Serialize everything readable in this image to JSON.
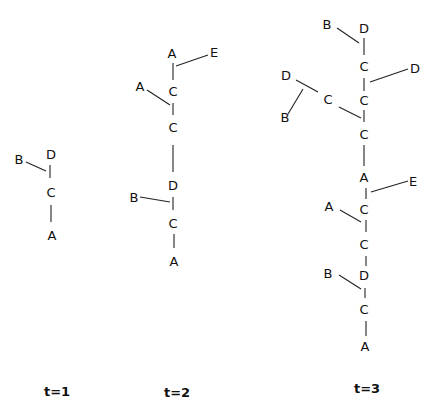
{
  "diagram": {
    "type": "tree-growth",
    "panels": [
      {
        "caption": "t=1",
        "nodes": [
          {
            "id": "t1_B",
            "label": "B",
            "x": 19,
            "y": 160
          },
          {
            "id": "t1_D",
            "label": "D",
            "x": 51,
            "y": 155
          },
          {
            "id": "t1_C",
            "label": "C",
            "x": 51,
            "y": 193
          },
          {
            "id": "t1_A",
            "label": "A",
            "x": 52,
            "y": 236
          }
        ],
        "edges": [
          [
            26,
            162,
            46,
            171
          ],
          [
            50,
            165,
            50,
            178
          ],
          [
            51,
            205,
            51,
            222
          ]
        ]
      },
      {
        "caption": "t=2",
        "nodes": [
          {
            "id": "t2_A1",
            "label": "A",
            "x": 172,
            "y": 54
          },
          {
            "id": "t2_E",
            "label": "E",
            "x": 214,
            "y": 53
          },
          {
            "id": "t2_A2",
            "label": "A",
            "x": 140,
            "y": 87
          },
          {
            "id": "t2_C1",
            "label": "C",
            "x": 173,
            "y": 92
          },
          {
            "id": "t2_C2",
            "label": "C",
            "x": 173,
            "y": 128
          },
          {
            "id": "t2_D",
            "label": "D",
            "x": 173,
            "y": 186
          },
          {
            "id": "t2_B",
            "label": "B",
            "x": 134,
            "y": 198
          },
          {
            "id": "t2_C3",
            "label": "C",
            "x": 173,
            "y": 224
          },
          {
            "id": "t2_A3",
            "label": "A",
            "x": 174,
            "y": 262
          }
        ],
        "edges": [
          [
            173,
            63,
            173,
            80
          ],
          [
            176,
            66,
            208,
            55
          ],
          [
            147,
            90,
            170,
            105
          ],
          [
            173,
            103,
            173,
            115
          ],
          [
            173,
            145,
            173,
            172
          ],
          [
            140,
            197,
            170,
            202
          ],
          [
            173,
            197,
            173,
            210
          ],
          [
            174,
            234,
            174,
            248
          ]
        ]
      },
      {
        "caption": "t=3",
        "nodes": [
          {
            "id": "t3_B1",
            "label": "B",
            "x": 327,
            "y": 25
          },
          {
            "id": "t3_D1",
            "label": "D",
            "x": 364,
            "y": 29
          },
          {
            "id": "t3_C1",
            "label": "C",
            "x": 364,
            "y": 67
          },
          {
            "id": "t3_D2",
            "label": "D",
            "x": 415,
            "y": 69
          },
          {
            "id": "t3_D3",
            "label": "D",
            "x": 286,
            "y": 76
          },
          {
            "id": "t3_C2",
            "label": "C",
            "x": 328,
            "y": 100
          },
          {
            "id": "t3_C3",
            "label": "C",
            "x": 364,
            "y": 101
          },
          {
            "id": "t3_B2",
            "label": "B",
            "x": 285,
            "y": 118
          },
          {
            "id": "t3_C4",
            "label": "C",
            "x": 364,
            "y": 135
          },
          {
            "id": "t3_A1",
            "label": "A",
            "x": 364,
            "y": 178
          },
          {
            "id": "t3_E",
            "label": "E",
            "x": 413,
            "y": 182
          },
          {
            "id": "t3_A2",
            "label": "A",
            "x": 329,
            "y": 207
          },
          {
            "id": "t3_C5",
            "label": "C",
            "x": 364,
            "y": 210
          },
          {
            "id": "t3_C6",
            "label": "C",
            "x": 364,
            "y": 245
          },
          {
            "id": "t3_B3",
            "label": "B",
            "x": 328,
            "y": 274
          },
          {
            "id": "t3_D4",
            "label": "D",
            "x": 364,
            "y": 276
          },
          {
            "id": "t3_C7",
            "label": "C",
            "x": 364,
            "y": 310
          },
          {
            "id": "t3_A3",
            "label": "A",
            "x": 365,
            "y": 347
          }
        ],
        "edges": [
          [
            337,
            28,
            359,
            43
          ],
          [
            364,
            38,
            364,
            55
          ],
          [
            370,
            82,
            408,
            69
          ],
          [
            364,
            78,
            364,
            91
          ],
          [
            296,
            80,
            318,
            92
          ],
          [
            288,
            114,
            303,
            89
          ],
          [
            339,
            107,
            361,
            118
          ],
          [
            364,
            110,
            364,
            122
          ],
          [
            364,
            145,
            364,
            166
          ],
          [
            371,
            192,
            408,
            181
          ],
          [
            366,
            188,
            366,
            199
          ],
          [
            340,
            210,
            361,
            222
          ],
          [
            366,
            220,
            366,
            232
          ],
          [
            366,
            256,
            366,
            266
          ],
          [
            339,
            275,
            361,
            289
          ],
          [
            365,
            288,
            365,
            298
          ],
          [
            366,
            321,
            366,
            336
          ]
        ]
      }
    ]
  },
  "captions": {
    "t1": "t=1",
    "t2": "t=2",
    "t3": "t=3"
  }
}
